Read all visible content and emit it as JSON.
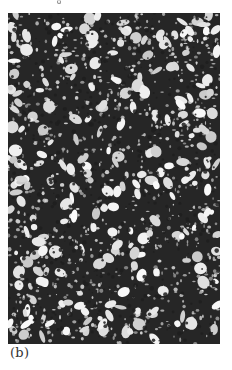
{
  "figure": {
    "panel_label": "(b)",
    "image_description": "micrograph-thin-section",
    "colors": {
      "matrix": "#262626",
      "grains": "#f2f2f2",
      "background": "#ffffff"
    }
  }
}
